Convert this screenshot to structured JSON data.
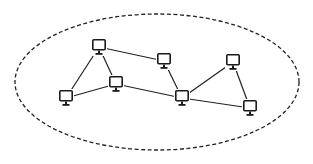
{
  "diagram": {
    "type": "network-topology",
    "boundary": {
      "shape": "ellipse",
      "style": "dashed",
      "cx": 157,
      "cy": 82,
      "rx": 142,
      "ry": 68,
      "color": "#222222"
    },
    "node_icon": "computer-monitor-icon",
    "line_color": "#222222",
    "nodes": [
      {
        "id": "n1",
        "x": 99,
        "y": 47
      },
      {
        "id": "n2",
        "x": 116,
        "y": 84
      },
      {
        "id": "n3",
        "x": 66,
        "y": 98
      },
      {
        "id": "n4",
        "x": 164,
        "y": 61
      },
      {
        "id": "n5",
        "x": 182,
        "y": 98
      },
      {
        "id": "n6",
        "x": 233,
        "y": 62
      },
      {
        "id": "n7",
        "x": 250,
        "y": 108
      }
    ],
    "edges": [
      [
        "n1",
        "n3"
      ],
      [
        "n1",
        "n2"
      ],
      [
        "n1",
        "n4"
      ],
      [
        "n3",
        "n2"
      ],
      [
        "n2",
        "n5"
      ],
      [
        "n4",
        "n5"
      ],
      [
        "n5",
        "n6"
      ],
      [
        "n6",
        "n7"
      ],
      [
        "n5",
        "n7"
      ]
    ]
  }
}
